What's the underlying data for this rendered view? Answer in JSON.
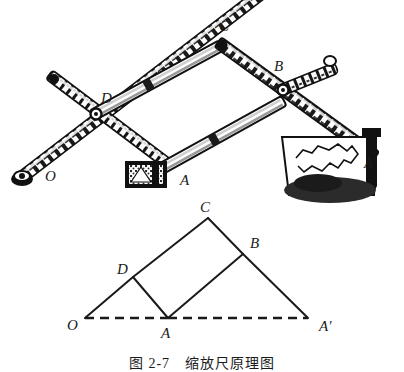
{
  "figure": {
    "caption": "图 2-7　缩放尺原理图",
    "background_color": "#ffffff",
    "ink_color": "#1a1a1a",
    "width": 404,
    "height": 372
  },
  "photo_panel": {
    "name": "pantograph-photograph",
    "description": "halftone photograph of a pantograph scaling ruler",
    "labels": [
      {
        "id": "O",
        "text": "O",
        "x": 45,
        "y": 176
      },
      {
        "id": "D",
        "text": "D",
        "x": 101,
        "y": 98
      },
      {
        "id": "C",
        "text": "C",
        "x": 219,
        "y": 26
      },
      {
        "id": "B",
        "text": "B",
        "x": 274,
        "y": 66
      },
      {
        "id": "A",
        "text": "A",
        "x": 180,
        "y": 180
      },
      {
        "id": "Ap",
        "text": "A′",
        "x": 364,
        "y": 163
      }
    ],
    "joints": {
      "O": {
        "x": 22,
        "y": 177
      },
      "D": {
        "x": 96,
        "y": 114
      },
      "C": {
        "x": 222,
        "y": 45
      },
      "B": {
        "x": 283,
        "y": 90
      },
      "A": {
        "x": 160,
        "y": 170
      },
      "Ap": {
        "x": 376,
        "y": 136
      },
      "long_bar_left_end": {
        "x": 53,
        "y": 78
      },
      "long_bar_right_end": {
        "x": 331,
        "y": 62
      }
    },
    "parts": [
      {
        "name": "pivot-weight",
        "at": "O"
      },
      {
        "name": "tracer-block",
        "at": "A"
      },
      {
        "name": "drawing-paper",
        "at": "A′"
      },
      {
        "name": "pencil-holder",
        "at": "A′"
      },
      {
        "name": "map-outline",
        "at": "A′"
      }
    ]
  },
  "schematic_panel": {
    "name": "pantograph-schematic",
    "vertices": [
      {
        "id": "O",
        "label": "O",
        "x": 85,
        "y": 318,
        "label_x": 67,
        "label_y": 325
      },
      {
        "id": "D",
        "label": "D",
        "x": 133,
        "y": 277,
        "label_x": 119,
        "label_y": 269
      },
      {
        "id": "C",
        "label": "C",
        "x": 208,
        "y": 218,
        "label_x": 200,
        "label_y": 207
      },
      {
        "id": "B",
        "label": "B",
        "x": 243,
        "y": 254,
        "label_x": 252,
        "label_y": 245
      },
      {
        "id": "A",
        "label": "A",
        "x": 168,
        "y": 318,
        "label_x": 163,
        "label_y": 334
      },
      {
        "id": "Ap",
        "label": "A′",
        "x": 308,
        "y": 318,
        "label_x": 320,
        "label_y": 327
      }
    ],
    "solid_edges": [
      {
        "from": "O",
        "to": "D"
      },
      {
        "from": "D",
        "to": "C"
      },
      {
        "from": "C",
        "to": "B"
      },
      {
        "from": "B",
        "to": "Ap"
      },
      {
        "from": "D",
        "to": "A"
      },
      {
        "from": "A",
        "to": "B"
      }
    ],
    "dashed_edges": [
      {
        "from": "O",
        "to": "A"
      },
      {
        "from": "A",
        "to": "Ap"
      }
    ],
    "line_style": {
      "solid_width": 2.0,
      "dashed_width": 2.4,
      "dash_pattern": "9 6"
    }
  }
}
